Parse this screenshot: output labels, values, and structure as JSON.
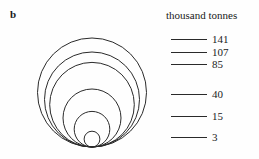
{
  "panel": {
    "letter": "b"
  },
  "legend": {
    "title": "thousand tonnes",
    "entries": [
      {
        "value": "141",
        "line_y": 39
      },
      {
        "value": "107",
        "line_y": 52
      },
      {
        "value": "85",
        "line_y": 64
      },
      {
        "value": "40",
        "line_y": 94
      },
      {
        "value": "15",
        "line_y": 116
      },
      {
        "value": "3",
        "line_y": 137
      }
    ]
  },
  "colors": {
    "stroke": "#2a2a2a",
    "text": "#1a1a1a",
    "background": "#fefefe"
  },
  "chart_data": {
    "type": "bubble",
    "title": "",
    "subtitle": "",
    "units": "thousand tonnes",
    "layout": "nested-proportional-circles-tangent-at-bottom",
    "baseline_y": 147,
    "center_x": 92,
    "area_proportional": true,
    "categories": [
      "141",
      "107",
      "85",
      "40",
      "15",
      "3"
    ],
    "values": [
      141,
      107,
      85,
      40,
      15,
      3
    ],
    "labels": [
      "141",
      "107",
      "85",
      "40",
      "15",
      "3"
    ],
    "circles": [
      {
        "value": 141,
        "radius": 54.5,
        "cx": 92,
        "cy": 92.5
      },
      {
        "value": 107,
        "radius": 47.5,
        "cx": 92,
        "cy": 99.5
      },
      {
        "value": 85,
        "radius": 42.3,
        "cx": 92,
        "cy": 104.7
      },
      {
        "value": 40,
        "radius": 29.0,
        "cx": 92,
        "cy": 118.0
      },
      {
        "value": 15,
        "radius": 17.8,
        "cx": 92,
        "cy": 129.2
      },
      {
        "value": 3,
        "radius": 7.9,
        "cx": 92,
        "cy": 139.1
      }
    ],
    "xlabel": "",
    "ylabel": "",
    "legend_position": "right",
    "grid": false
  }
}
